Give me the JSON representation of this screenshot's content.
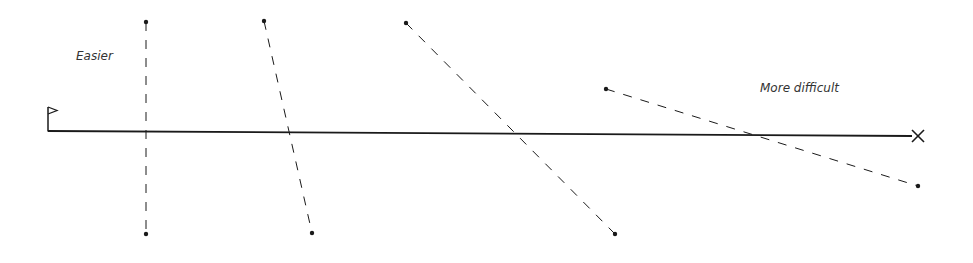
{
  "labels": {
    "easier": "Easier",
    "more_difficult": "More difficult"
  },
  "colors": {
    "line": "#1a1a1a",
    "text": "#333333",
    "background": "#ffffff"
  },
  "baseline": {
    "x1": 48,
    "y1": 131,
    "x2": 912,
    "y2": 136
  },
  "start_marker": "flag-icon",
  "end_marker": "cross-icon",
  "segments": [
    {
      "x1": 146,
      "y1": 22,
      "x2": 146,
      "y2": 234
    },
    {
      "x1": 264,
      "y1": 21,
      "x2": 312,
      "y2": 233
    },
    {
      "x1": 406,
      "y1": 23,
      "x2": 615,
      "y2": 234
    },
    {
      "x1": 606,
      "y1": 89,
      "x2": 918,
      "y2": 186
    }
  ]
}
